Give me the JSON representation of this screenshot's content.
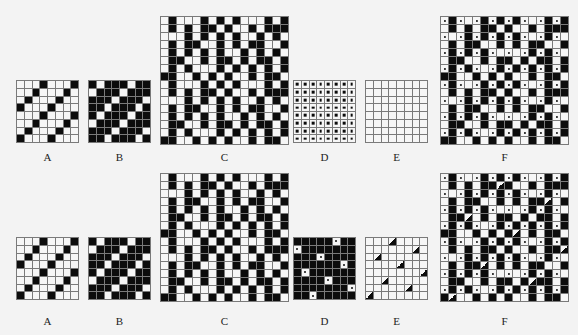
{
  "figure": {
    "rows": [
      {
        "panels": [
          {
            "id": "A",
            "label": "A",
            "x": 16,
            "y": 80,
            "size": 63,
            "n": 8,
            "cells": [
              "WWWBWWWB",
              "WWBWWWBW",
              "WBWWWBWW",
              "BWWWBWWW",
              "WWWBWWWB",
              "WWBWWWBW",
              "WBWWWBWW",
              "BWWWBWWW"
            ]
          },
          {
            "id": "B",
            "label": "B",
            "x": 88,
            "y": 80,
            "size": 63,
            "n": 8,
            "cells": [
              "BWBBBWBB",
              "WBBBWBBB",
              "BBBWBBBW",
              "BBWBBBWB",
              "BWBBBWBB",
              "WBBBWBBB",
              "BBBWBBBW",
              "BBWBBBWB"
            ]
          },
          {
            "id": "C",
            "label": "C",
            "x": 160,
            "y": 16,
            "size": 129,
            "n": 16,
            "cells": [
              "WBWWWBWBWBWWWBWB",
              "WBWBWBBWBWWBWBBB",
              "WWWBWBWBWBWWBWBW",
              "WBWBBWWBWBWBBWWB",
              "WBWBWBWBWWBWBWBW",
              "WBBWWBWBBWBWBBWB",
              "WBWBWWWBWBWBWBWB",
              "BBWWBWBWBWWBWBBW",
              "WBWWWBWBWBWWWBWB",
              "WBWBWBBWBWWBWBBB",
              "WWWBWBWBWBWWBWBW",
              "WBWBBWWBWBWBBWWB",
              "WBWBWBWBWWBWBWBW",
              "WBBWWBWBBWBWBBWB",
              "WBWBWWWBWBWBWBWB",
              "BBWWBWBWBWWBWBBW"
            ]
          },
          {
            "id": "D",
            "label": "D",
            "x": 293,
            "y": 80,
            "size": 63,
            "n": 8,
            "cells": [
              "DDDDDDDD",
              "DDDDDDDD",
              "DDDDDDDD",
              "DDDDDDDD",
              "DDDDDDDD",
              "DDDDDDDD",
              "DDDDDDDD",
              "DDDDDDDD"
            ]
          },
          {
            "id": "E",
            "label": "E",
            "x": 365,
            "y": 80,
            "size": 63,
            "n": 8,
            "cells": [
              "WWWWWWWW",
              "WWWWWWWW",
              "WWWWWWWW",
              "WWWWWWWW",
              "WWWWWWWW",
              "WWWWWWWW",
              "WWWWWWWW",
              "WWWWWWWW"
            ]
          },
          {
            "id": "F",
            "label": "F",
            "x": 440,
            "y": 16,
            "size": 129,
            "n": 16,
            "cells": [
              "OBOWOBOBOBOWOBOB",
              "WBWBWBBWBWWBWBBB",
              "OWOBOBOBOBOWOBOW",
              "WBWBBWWBWBWBBWWB",
              "OBOBOBOWOWOBOBOW",
              "WBBWWBWBBWBWBBWB",
              "OBOBOWOBOBOBOBOB",
              "BBWWBWBWBWWBWBBW",
              "OBOWOBOBOBOWOBOB",
              "WBWBWBBWBWWBWBBB",
              "OWOBOBOBOBOWOBOW",
              "WBWBBWWBWBWBBWWB",
              "OBOBOBOWOWOBOBOW",
              "WBBWWBWBBWBWBBWB",
              "OBOBOWOBOBOBOBOB",
              "BBWWBWBWBWWBWBBW"
            ]
          }
        ],
        "label_y": 151
      },
      {
        "panels": [
          {
            "id": "A2",
            "label": "A",
            "x": 16,
            "y": 237,
            "size": 63,
            "n": 8,
            "cells": [
              "WWWBWWWB",
              "WWBWWWBW",
              "WBWWWBWW",
              "BWWWBWWW",
              "WWWBWWWB",
              "WWBWWWBW",
              "WBWWWBWW",
              "BWWWBWWW"
            ]
          },
          {
            "id": "B2",
            "label": "B",
            "x": 88,
            "y": 237,
            "size": 63,
            "n": 8,
            "cells": [
              "BWBBBWBB",
              "WBBBWBBB",
              "BBBWBBBW",
              "BBWBBBWB",
              "BWBBBWBB",
              "WBBBWBBB",
              "BBBWBBBW",
              "BBWBBBWB"
            ]
          },
          {
            "id": "C2",
            "label": "C",
            "x": 160,
            "y": 173,
            "size": 129,
            "n": 16,
            "cells": [
              "WBWWWBWBWBWWWBWB",
              "WBWBWBBWBWWBWBBB",
              "WWWBWBWBWBWWBWBW",
              "WBWBBWWBWBWBBWWB",
              "WBWBWBWBWWBWBWBW",
              "WBBWWBWBBWBWBBWB",
              "WBWBWWWBWBWBWBWB",
              "BBWWBWBWBWWBWBBW",
              "WBWWWBWBWBWWWBWB",
              "WBWBWBBWBWWBWBBB",
              "WWWBWBWBWBWWBWBW",
              "WBWBBWWBWBWBBWWB",
              "WBWBWBWBWWBWBWBW",
              "WBBWWBWBBWBWBBWB",
              "WBWBWWWBWBWBWBWB",
              "BBWWBWBWBWWBWBBW"
            ]
          },
          {
            "id": "D2",
            "label": "D",
            "x": 293,
            "y": 237,
            "size": 63,
            "n": 8,
            "cells": [
              "BBBBBOBB",
              "OBBBBBBB",
              "BBBOBBBB",
              "BBBBBBOB",
              "BOBBBBBB",
              "BBBBOBBB",
              "BBBBBBBO",
              "BBOBBBBB"
            ]
          },
          {
            "id": "E2",
            "label": "E",
            "x": 365,
            "y": 237,
            "size": 63,
            "n": 8,
            "cells": [
              "WWWTWWWW",
              "WWWWWWTW",
              "WTWWWWWW",
              "WWWWTWWW",
              "WWWWWWWT",
              "WWTWWWWW",
              "WWWWWTWW",
              "TWWWWWWW"
            ]
          },
          {
            "id": "F2",
            "label": "F",
            "x": 440,
            "y": 173,
            "size": 129,
            "n": 16,
            "cells": [
              "OBOWOBOBOBOWOBOB",
              "WBWBWBBTBWWBWBBB",
              "OWOBOBOBOBOWOBOW",
              "WBWBBWWBWBWBBTWB",
              "OBOBOBOWOWOBOBOW",
              "WBBTWBWBBWBWBBWB",
              "OBOBOWOBOBOBOBOB",
              "BBWWBWBWBTWBWBBW",
              "OBOWOBOBOBOWOBOB",
              "WBWBWBBWBWWBWBBT",
              "OWOBOBOBOBOWOBOW",
              "WBWBBTWBWBWBBWWB",
              "OBOBOBOWOWOBOBOW",
              "WBBWWBWBBWBTBBWB",
              "OBOBOWOBOBOBOBOB",
              "BTWWBWBWBWWBWBBW"
            ]
          }
        ],
        "label_y": 315
      }
    ]
  }
}
